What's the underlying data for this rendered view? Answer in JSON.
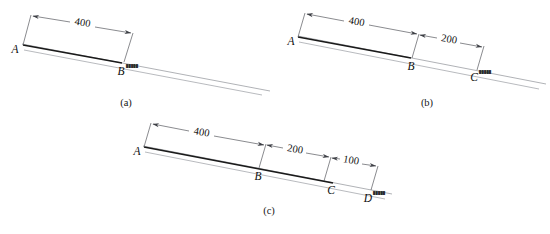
{
  "figure": {
    "background_color": "#ffffff",
    "line_color": "#4a4c52",
    "bold_color": "#1a1a1a",
    "ground_color": "#8e9096"
  },
  "panels": [
    {
      "id": "a",
      "caption": "(a)",
      "points": [
        {
          "label": "A",
          "name": "point-a"
        },
        {
          "label": "B",
          "name": "point-b"
        }
      ],
      "dimensions": [
        {
          "value": "400",
          "from": "A",
          "to": "B"
        }
      ],
      "annotations": [
        {
          "near": "B",
          "text": "█████"
        }
      ]
    },
    {
      "id": "b",
      "caption": "(b)",
      "points": [
        {
          "label": "A",
          "name": "point-a"
        },
        {
          "label": "B",
          "name": "point-b"
        },
        {
          "label": "C",
          "name": "point-c"
        }
      ],
      "dimensions": [
        {
          "value": "400",
          "from": "A",
          "to": "B"
        },
        {
          "value": "200",
          "from": "B",
          "to": "C"
        }
      ],
      "annotations": [
        {
          "near": "C",
          "text": "█████"
        }
      ]
    },
    {
      "id": "c",
      "caption": "(c)",
      "points": [
        {
          "label": "A",
          "name": "point-a"
        },
        {
          "label": "B",
          "name": "point-b"
        },
        {
          "label": "C",
          "name": "point-c"
        },
        {
          "label": "D",
          "name": "point-d"
        }
      ],
      "dimensions": [
        {
          "value": "400",
          "from": "A",
          "to": "B"
        },
        {
          "value": "200",
          "from": "B",
          "to": "C"
        },
        {
          "value": "100",
          "from": "C",
          "to": "D"
        }
      ],
      "annotations": [
        {
          "near": "D",
          "text": "█████"
        }
      ]
    }
  ],
  "labels": {
    "panel_a": {
      "caption": "(a)",
      "A": "A",
      "B": "B",
      "dim_400": "400",
      "mark_b": "█████"
    },
    "panel_b": {
      "caption": "(b)",
      "A": "A",
      "B": "B",
      "C": "C",
      "dim_400": "400",
      "dim_200": "200",
      "mark_c": "█████"
    },
    "panel_c": {
      "caption": "(c)",
      "A": "A",
      "B": "B",
      "C": "C",
      "D": "D",
      "dim_400": "400",
      "dim_200": "200",
      "dim_100": "100",
      "mark_d": "█████"
    }
  }
}
